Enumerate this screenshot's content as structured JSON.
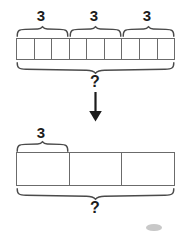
{
  "diagram": {
    "type": "tape-diagram",
    "top_bar": {
      "name": "top-tape-bar",
      "cells": 9,
      "x": 16,
      "y": 38,
      "width": 159,
      "height": 22,
      "group_labels": [
        "3",
        "3",
        "3"
      ],
      "group_brace_spans": [
        {
          "from_cell": 0,
          "to_cell": 2
        },
        {
          "from_cell": 3,
          "to_cell": 5
        },
        {
          "from_cell": 6,
          "to_cell": 8
        }
      ],
      "total_label": "?"
    },
    "arrow": {
      "name": "transform-arrow",
      "direction": "down",
      "color": "#1c1c1c"
    },
    "bottom_bar": {
      "name": "bottom-tape-bar",
      "cells": 3,
      "x": 16,
      "y": 152,
      "width": 159,
      "height": 34,
      "group_labels": [
        "3"
      ],
      "group_brace_spans": [
        {
          "from_cell": 0,
          "to_cell": 0
        }
      ],
      "total_label": "?"
    },
    "colors": {
      "stroke": "#6b6b6b",
      "brace": "#4a4a4a",
      "text": "#1c1c1c",
      "background": "#ffffff"
    }
  }
}
